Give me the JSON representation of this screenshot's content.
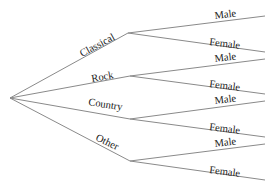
{
  "diagram": {
    "type": "tree",
    "root": {
      "x": 10,
      "y": 98
    },
    "colors": {
      "edge": "#8a8a8a",
      "text": "#1a1a1a",
      "background": "#ffffff"
    },
    "genres": [
      {
        "label": "Classical",
        "node": {
          "x": 128,
          "y": 33
        },
        "hx": 140,
        "leaves": [
          {
            "label": "Male",
            "y": 16
          },
          {
            "label": "Female",
            "y": 52
          }
        ]
      },
      {
        "label": "Rock",
        "node": {
          "x": 130,
          "y": 76
        },
        "hx": 140,
        "leaves": [
          {
            "label": "Male",
            "y": 59
          },
          {
            "label": "Female",
            "y": 94
          }
        ]
      },
      {
        "label": "Country",
        "node": {
          "x": 130,
          "y": 119
        },
        "hx": 140,
        "leaves": [
          {
            "label": "Male",
            "y": 101
          },
          {
            "label": "Female",
            "y": 137
          }
        ]
      },
      {
        "label": "Other",
        "node": {
          "x": 130,
          "y": 161
        },
        "hx": 140,
        "leaves": [
          {
            "label": "Male",
            "y": 144
          },
          {
            "label": "Female",
            "y": 180
          }
        ]
      }
    ],
    "leaf_x": 265
  }
}
